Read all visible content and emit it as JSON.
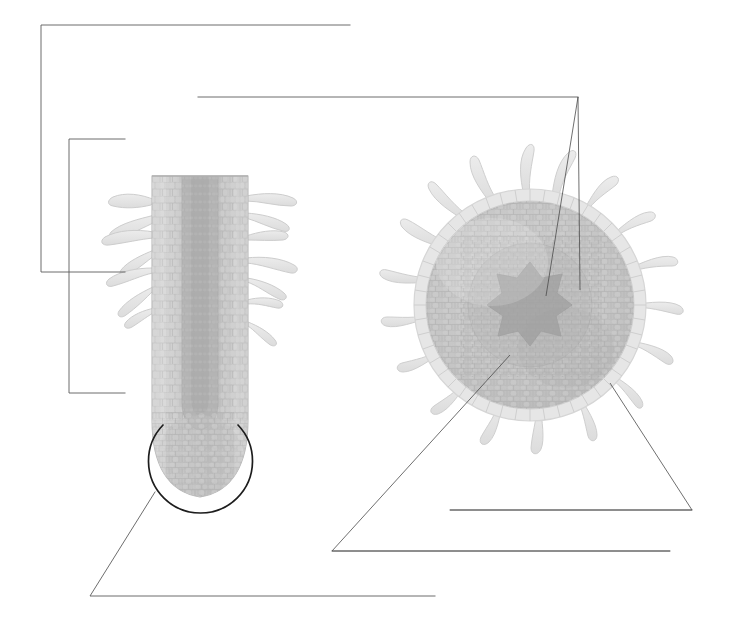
{
  "document": {
    "type": "botanical-labeling-worksheet",
    "subject": "Root anatomy",
    "background_color": "#ffffff",
    "width": 735,
    "height": 625,
    "label_text": "",
    "label_count": 7
  },
  "palette": {
    "line_color": "#5c5c5c",
    "leader_color": "#4a4a4a",
    "circle_color": "#1d1d1d",
    "epidermis_fill": "#e8e8e8",
    "epidermis_stroke": "#d2d2d2",
    "cortex_fill": "#c8c8c8",
    "cortex_stroke": "#b4b4b4",
    "stele_fill": "#b6b6b6",
    "vascular_fill": "#a9a9a9",
    "hair_fill": "#e6e6e6",
    "hair_stroke": "#cfcfcf",
    "cell_line": "#bdbdbd"
  },
  "figures": [
    {
      "id": "longitudinal-root",
      "name": "root-longitudinal-section",
      "position": "left",
      "center_x": 200,
      "top_y": 175,
      "bottom_y": 500,
      "width": 96,
      "description": "Longitudinal section of a root tip with root hairs along the sides and a rounded apex",
      "root_hair_count": 14
    },
    {
      "id": "cross-section-root",
      "name": "root-cross-section",
      "position": "right",
      "center_x": 530,
      "center_y": 305,
      "radius": 118,
      "description": "Transverse cross-section of a root showing epidermis, cortex, endodermis and central vascular cylinder with root hairs radiating outward",
      "root_hair_count": 16
    }
  ],
  "highlight": {
    "name": "root-tip-highlight-circle",
    "center_x": 200,
    "center_y": 461,
    "radius": 52,
    "gap_top": true
  },
  "label_lines": [
    {
      "id": 1,
      "name": "label-line-top-outer",
      "target": "root-hair-zone-outer",
      "blank": "",
      "path": "M 350 25 L 41 25 L 41 272 L 125 272"
    },
    {
      "id": 2,
      "name": "label-line-top-inner",
      "target": "root-epidermis",
      "blank": "",
      "path": "M 125 139 L 69 139 L 69 393 L 125 393"
    },
    {
      "id": 3,
      "name": "label-line-cross-section-upper",
      "target": "cross-section-overview",
      "blank": "",
      "path": "M 198 97 L 578 97"
    },
    {
      "id": 4,
      "name": "label-line-vascular-cylinder",
      "target": "vascular-cylinder-xylem",
      "blank": "",
      "path": "M 578 97 L 546 296"
    },
    {
      "id": 5,
      "name": "label-line-phloem",
      "target": "phloem",
      "blank": "",
      "path": "M 578 97 L 580 290"
    },
    {
      "id": 6,
      "name": "label-line-root-tip",
      "target": "root-tip-apical-meristem",
      "blank": "",
      "path": "M 155 492 L 90 596 L 435 596"
    },
    {
      "id": 7,
      "name": "label-line-cortex",
      "target": "cortex",
      "blank": "",
      "path": "M 510 355 L 332 551 L 670 551"
    },
    {
      "id": 8,
      "name": "label-line-epidermis-cross",
      "target": "epidermis-cross-section",
      "blank": "",
      "path": "M 610 383 L 692 510 L 450 510"
    }
  ],
  "answer_blanks": [
    {
      "id": "blank-1",
      "name": "write-on-line-1",
      "x1": 41,
      "y1": 25,
      "x2": 350,
      "y2": 25
    },
    {
      "id": "blank-2",
      "name": "write-on-line-2",
      "x1": 198,
      "y1": 97,
      "x2": 578,
      "y2": 97
    },
    {
      "id": "blank-3",
      "name": "write-on-line-3",
      "x1": 69,
      "y1": 139,
      "x2": 125,
      "y2": 139
    },
    {
      "id": "blank-4",
      "name": "write-on-line-4",
      "x1": 41,
      "y1": 272,
      "x2": 125,
      "y2": 272
    },
    {
      "id": "blank-5",
      "name": "write-on-line-5",
      "x1": 69,
      "y1": 393,
      "x2": 125,
      "y2": 393
    },
    {
      "id": "blank-6",
      "name": "write-on-line-6",
      "x1": 450,
      "y1": 510,
      "x2": 692,
      "y2": 510
    },
    {
      "id": "blank-7",
      "name": "write-on-line-7",
      "x1": 332,
      "y1": 551,
      "x2": 670,
      "y2": 551
    },
    {
      "id": "blank-8",
      "name": "write-on-line-8",
      "x1": 90,
      "y1": 596,
      "x2": 435,
      "y2": 596
    }
  ]
}
